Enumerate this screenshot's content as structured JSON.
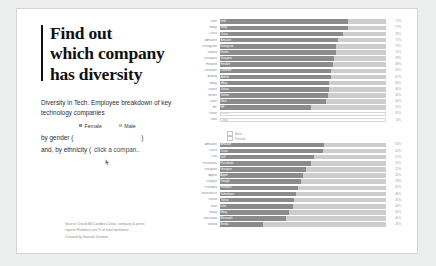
{
  "headline": {
    "line1": "Find out",
    "line2": "which company",
    "line3": "has diversity"
  },
  "deck": "Diversity in Tech. Employee breakdown of key technology companies",
  "legend": {
    "female": "Female",
    "male": "Male"
  },
  "controls": {
    "gender_label": "by gender (",
    "gender_close": ")",
    "ethnicity_label": "and, by ethnicity (",
    "hint": "click a compan.."
  },
  "credit": {
    "line1": "Source: David McCandless    Data:  company & press",
    "line2": "reports Numbers are % of total workforce",
    "line3": "Created by Satoshi Gamate"
  },
  "chart_data": [
    {
      "type": "bar",
      "title": "",
      "xlabel": "",
      "ylabel": "",
      "xlim": [
        0,
        100
      ],
      "grid": false,
      "legend": [
        "Female",
        "Male"
      ],
      "categories": [
        "Intel",
        "Ebay",
        "Cisco",
        "Amazon",
        "Instagram",
        "Nvidia",
        "Groupon",
        "Hewlett",
        "LinkedIn",
        "Airbnb",
        "eBay",
        "Yahoo",
        "Twitter",
        "Uber",
        "HP"
      ],
      "series": [
        {
          "name": "Male",
          "values": [
            77,
            77,
            74,
            71,
            70,
            70,
            69,
            68,
            67,
            67,
            66,
            66,
            65,
            64,
            55
          ]
        },
        {
          "name": "Female",
          "values": [
            23,
            23,
            26,
            29,
            30,
            30,
            31,
            32,
            33,
            33,
            34,
            34,
            35,
            36,
            45
          ]
        }
      ],
      "value_labels": [
        "77%",
        "77%",
        "74%",
        "71%",
        "70%",
        "70%",
        "69%",
        "68%",
        "67%",
        "67%",
        "66%",
        "66%",
        "65%",
        "64%",
        "55%"
      ],
      "outliers": [
        {
          "name": "Other",
          "value": 95,
          "label": "95%",
          "style": "empty"
        },
        {
          "name": "Total",
          "value": 13,
          "label": "13%",
          "style": "empty"
        }
      ]
    },
    {
      "type": "bar",
      "title": "",
      "xlabel": "",
      "ylabel": "",
      "xlim": [
        0,
        100
      ],
      "grid": false,
      "legend": [
        "White",
        "Other"
      ],
      "categories": [
        "Amazon",
        "Cisco",
        "Dell",
        "Facebook",
        "Groupon",
        "Apple",
        "Google",
        "Pandora",
        "Salesforce",
        "Yahoo",
        "Intel",
        "Ebay",
        "Microsoft",
        "Nvidia"
      ],
      "series": [
        {
          "name": "White",
          "values": [
            63,
            62,
            57,
            55,
            52,
            50,
            49,
            47,
            46,
            45,
            44,
            42,
            40,
            26
          ]
        },
        {
          "name": "Other",
          "values": [
            37,
            38,
            43,
            45,
            48,
            50,
            51,
            53,
            54,
            55,
            56,
            58,
            60,
            74
          ]
        }
      ],
      "value_labels": [
        "63%",
        "62%",
        "57%",
        "55%",
        "52%",
        "50%",
        "49%",
        "47%",
        "46%",
        "45%",
        "44%",
        "42%",
        "40%",
        "26%"
      ],
      "minilegend": [
        "Male",
        "Female"
      ]
    }
  ]
}
